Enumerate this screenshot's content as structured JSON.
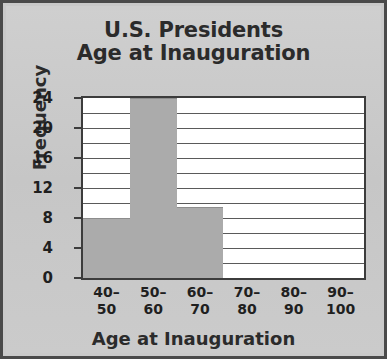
{
  "figure": {
    "background_color": "#c9c9c9",
    "frame_color": "#4a4a4a",
    "plot_background_color": "#ffffff",
    "bar_color": "#ababab",
    "grid_color": "#5a5a5a",
    "text_color": "#2b2b2b"
  },
  "chart_data": {
    "type": "bar",
    "title": "U.S. Presidents Age at Inauguration",
    "title_line1": "U.S. Presidents",
    "title_line2": "Age at Inauguration",
    "xlabel": "Age at Inauguration",
    "ylabel": "Frequency",
    "categories": [
      "40–50",
      "50–60",
      "60–70",
      "70–80",
      "80–90",
      "90–100"
    ],
    "category_lines": [
      {
        "top": "40–",
        "bottom": "50"
      },
      {
        "top": "50–",
        "bottom": "60"
      },
      {
        "top": "60–",
        "bottom": "70"
      },
      {
        "top": "70–",
        "bottom": "80"
      },
      {
        "top": "80–",
        "bottom": "90"
      },
      {
        "top": "90–",
        "bottom": "100"
      }
    ],
    "values": [
      8,
      24,
      9.5,
      0,
      0,
      0
    ],
    "ylim": [
      0,
      24
    ],
    "xlim_bins": 6,
    "ytick_labels": [
      "0",
      "4",
      "8",
      "12",
      "16",
      "20",
      "24"
    ],
    "ytick_values": [
      0,
      4,
      8,
      12,
      16,
      20,
      24
    ],
    "gridline_values": [
      2,
      4,
      6,
      8,
      10,
      12,
      14,
      16,
      18,
      20,
      22
    ],
    "grid": true,
    "legend": false,
    "legend_position": "none"
  }
}
